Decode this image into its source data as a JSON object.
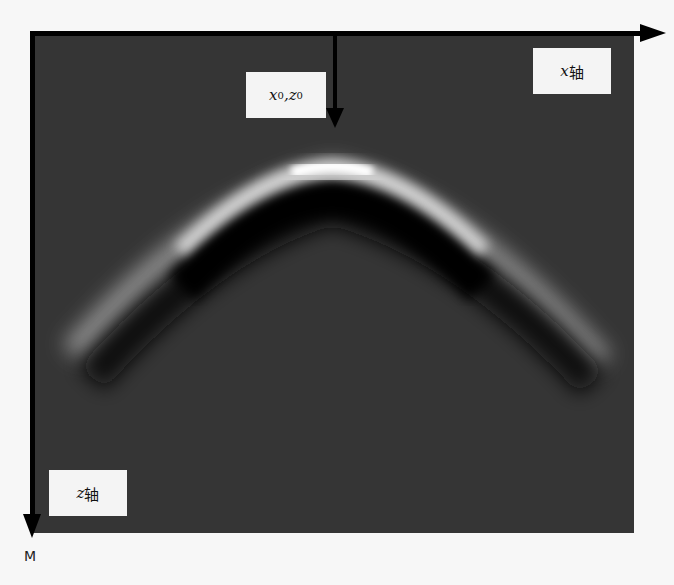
{
  "diagram": {
    "title": "",
    "source_point": {
      "x_var": "x",
      "z_var": "z",
      "subscript": "0",
      "separator": ","
    },
    "x_axis": {
      "var": "x",
      "label": "轴"
    },
    "z_axis": {
      "var": "z",
      "label": "轴"
    },
    "corner_label": "M",
    "colors": {
      "background": "#f7f7f7",
      "panel": "#353535",
      "axes": "#000000",
      "label_box": "#f4f4f4"
    },
    "content": "Diffraction hyperbola (bright upper band over dark lower band) with apex at source point"
  }
}
